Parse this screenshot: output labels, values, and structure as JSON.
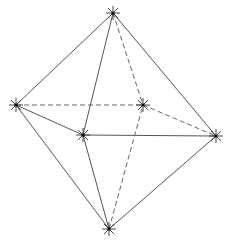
{
  "diagram": {
    "type": "octahedron-wireframe",
    "colors": {
      "background": "#ffffff",
      "solid_edge": "#555555",
      "dashed_edge": "#666666",
      "vertex_marker": "#333333"
    },
    "vertices": [
      {
        "id": "top",
        "x": 113,
        "y": 13
      },
      {
        "id": "left",
        "x": 16,
        "y": 105
      },
      {
        "id": "back",
        "x": 143,
        "y": 105
      },
      {
        "id": "front",
        "x": 83,
        "y": 135
      },
      {
        "id": "right",
        "x": 216,
        "y": 136
      },
      {
        "id": "bottom",
        "x": 109,
        "y": 229
      }
    ],
    "edges": [
      {
        "from": "top",
        "to": "left",
        "style": "solid"
      },
      {
        "from": "top",
        "to": "front",
        "style": "solid"
      },
      {
        "from": "top",
        "to": "right",
        "style": "solid"
      },
      {
        "from": "top",
        "to": "back",
        "style": "dashed"
      },
      {
        "from": "left",
        "to": "front",
        "style": "solid"
      },
      {
        "from": "front",
        "to": "right",
        "style": "solid"
      },
      {
        "from": "left",
        "to": "back",
        "style": "dashed"
      },
      {
        "from": "back",
        "to": "right",
        "style": "dashed"
      },
      {
        "from": "bottom",
        "to": "left",
        "style": "solid"
      },
      {
        "from": "bottom",
        "to": "front",
        "style": "solid"
      },
      {
        "from": "bottom",
        "to": "right",
        "style": "solid"
      },
      {
        "from": "bottom",
        "to": "back",
        "style": "dashed"
      }
    ],
    "marker": {
      "shape": "asterisk",
      "spokes": 8,
      "radius": 7
    }
  }
}
